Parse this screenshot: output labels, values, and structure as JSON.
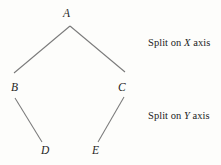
{
  "figure": {
    "type": "binary-tree-diagram",
    "background_color": "#fdfdfb",
    "line_color": "#6f6f6f",
    "text_color": "#1f1f1f"
  },
  "nodes": [
    {
      "id": "A",
      "label": "A",
      "x": 68,
      "y": 14
    },
    {
      "id": "B",
      "label": "B",
      "x": 15,
      "y": 88
    },
    {
      "id": "C",
      "label": "C",
      "x": 122,
      "y": 88
    },
    {
      "id": "D",
      "label": "D",
      "x": 45,
      "y": 151
    },
    {
      "id": "E",
      "label": "E",
      "x": 96,
      "y": 151
    }
  ],
  "edges": [
    {
      "from": "A",
      "to": "B",
      "x1": 70,
      "y1": 26,
      "x2": 14,
      "y2": 73
    },
    {
      "from": "A",
      "to": "C",
      "x1": 70,
      "y1": 26,
      "x2": 125,
      "y2": 72
    },
    {
      "from": "B",
      "to": "D",
      "x1": 15,
      "y1": 98,
      "x2": 42,
      "y2": 142
    },
    {
      "from": "C",
      "to": "E",
      "x1": 124,
      "y1": 97,
      "x2": 98,
      "y2": 142
    }
  ],
  "annotations": {
    "split_x": {
      "prefix": "Split on ",
      "axis": "X",
      "suffix": " axis",
      "full": "Split on X axis"
    },
    "split_y": {
      "prefix": "Split on ",
      "axis": "Y",
      "suffix": " axis",
      "full": "Split on Y axis"
    }
  }
}
